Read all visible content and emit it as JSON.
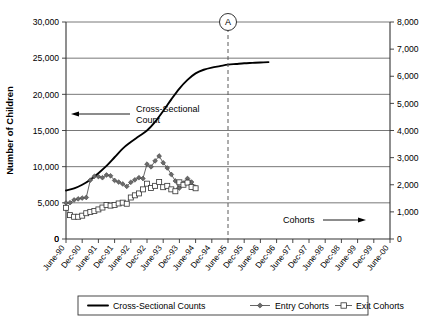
{
  "chart_data": {
    "type": "line",
    "title": "",
    "xlabel": "",
    "ylabel": "Number of Children",
    "y2label": "",
    "ylim": [
      0,
      30000
    ],
    "y2lim": [
      0,
      8000
    ],
    "grid": true,
    "legend_position": "bottom",
    "categories": [
      "June-90",
      "Dec-90",
      "June-91",
      "Dec-91",
      "June-92",
      "Dec-92",
      "June-93",
      "Dec-93",
      "June-94",
      "Dec-94",
      "June-95",
      "Dec-95",
      "June-96",
      "Dec-96",
      "June-97",
      "Dec-97",
      "June-98",
      "Dec-98",
      "June-99",
      "Dec-99",
      "June-00"
    ],
    "ytick_labels": [
      "0",
      "5,000",
      "10,000",
      "15,000",
      "20,000",
      "25,000",
      "30,000"
    ],
    "ytick_values": [
      0,
      5000,
      10000,
      15000,
      20000,
      25000,
      30000
    ],
    "y2tick_labels": [
      "0",
      "1,000",
      "2,000",
      "3,000",
      "4,000",
      "5,000",
      "6,000",
      "7,000",
      "8,000"
    ],
    "y2tick_values": [
      0,
      1000,
      2000,
      3000,
      4000,
      5000,
      6000,
      7000,
      8000
    ],
    "series": [
      {
        "name": "Cross-Sectional Counts",
        "axis": "left",
        "style": "solid-thick",
        "marker": "none",
        "color": "#000000",
        "x": [
          0,
          0.5,
          1,
          1.5,
          2,
          2.5,
          3,
          3.5,
          4,
          4.5,
          5,
          5.5,
          6,
          6.5,
          7,
          7.5,
          8,
          8.5,
          9,
          9.5,
          10,
          10.5,
          11,
          11.5,
          12,
          12.5
        ],
        "values": [
          6700,
          7000,
          7500,
          8200,
          9100,
          10100,
          11300,
          12500,
          13400,
          14200,
          15000,
          16200,
          17700,
          19300,
          20800,
          22000,
          22900,
          23400,
          23700,
          23900,
          24100,
          24200,
          24300,
          24350,
          24400,
          24450
        ]
      },
      {
        "name": "Entry Cohorts",
        "axis": "right",
        "style": "thin",
        "marker": "diamond",
        "color": "#6b6b6b",
        "x": [
          0,
          0.25,
          0.5,
          0.75,
          1,
          1.25,
          1.5,
          1.75,
          2,
          2.25,
          2.5,
          2.75,
          3,
          3.25,
          3.5,
          3.75,
          4,
          4.25,
          4.5,
          4.75,
          5,
          5.25,
          5.5,
          5.75,
          6,
          6.25,
          6.5
        ],
        "values": [
          1330,
          1340,
          1440,
          1480,
          1510,
          1530,
          2170,
          2310,
          2300,
          2260,
          2360,
          2330,
          2160,
          2100,
          2030,
          1940,
          2090,
          2180,
          2260,
          2230,
          2760,
          2660,
          2880,
          3060,
          2810,
          2620,
          2380
        ]
      },
      {
        "name": "Exit Cohorts",
        "axis": "right",
        "style": "thin",
        "marker": "square",
        "color": "#ffffff",
        "x": [
          0,
          0.25,
          0.5,
          0.75,
          1,
          1.25,
          1.5,
          1.75,
          2,
          2.25,
          2.5,
          2.75,
          3,
          3.25,
          3.5,
          3.75,
          4,
          4.25,
          4.5,
          4.75,
          5,
          5.25,
          5.5,
          5.75,
          6,
          6.25,
          6.5
        ],
        "values": [
          1150,
          880,
          820,
          820,
          860,
          950,
          1000,
          1030,
          1090,
          1160,
          1250,
          1230,
          1250,
          1310,
          1340,
          1300,
          1530,
          1610,
          1680,
          1830,
          2040,
          1880,
          1960,
          2100,
          1910,
          1960,
          1830
        ]
      }
    ],
    "entry_tail": {
      "x": [
        6.5,
        6.75,
        7.0,
        7.25,
        7.5,
        7.75,
        8.0
      ],
      "values": [
        2380,
        2140,
        1880,
        2060,
        2230,
        2100,
        1900
      ]
    },
    "exit_tail": {
      "x": [
        6.5,
        6.75,
        7.0,
        7.25,
        7.5,
        7.75,
        8.0
      ],
      "values": [
        1830,
        1760,
        2090,
        2000,
        2080,
        1920,
        1870
      ]
    },
    "annotations": [
      {
        "id": "callout-a",
        "text": "A",
        "type": "circled-marker-with-dashed-vline",
        "x_category": "June-95"
      },
      {
        "id": "cross-sectional-annot",
        "text": "Cross-Sectional\nCount",
        "line1": "Cross-Sectional",
        "line2": "Count",
        "arrow": "left"
      },
      {
        "id": "cohorts-annot",
        "text": "Cohorts",
        "arrow": "right"
      }
    ]
  },
  "legend": {
    "items": [
      {
        "label": "Cross-Sectional Counts",
        "marker": "line"
      },
      {
        "label": "Entry Cohorts",
        "marker": "diamond"
      },
      {
        "label": "Exit Cohorts",
        "marker": "square"
      }
    ]
  },
  "axes": {
    "y_left_title": "Number of Children"
  }
}
